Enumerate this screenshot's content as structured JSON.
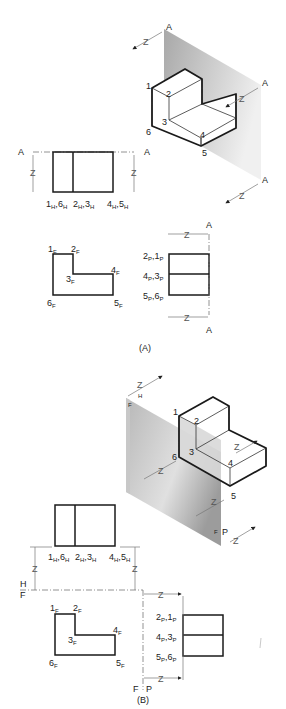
{
  "figure_A": {
    "caption": "(A)",
    "plane_label": "A",
    "depth_label": "Z",
    "iso_labels": [
      "1",
      "2",
      "3",
      "4",
      "5",
      "6"
    ],
    "top_view": {
      "labels": [
        {
          "main": "1",
          "sub": "H",
          "main2": "6",
          "sub2": "H"
        },
        {
          "main": "2",
          "sub": "H",
          "main2": "3",
          "sub2": "H"
        },
        {
          "main": "4",
          "sub": "H",
          "main2": "5",
          "sub2": "H"
        }
      ]
    },
    "front_view": {
      "labels": [
        {
          "main": "1",
          "sub": "F"
        },
        {
          "main": "2",
          "sub": "F"
        },
        {
          "main": "3",
          "sub": "F"
        },
        {
          "main": "4",
          "sub": "F"
        },
        {
          "main": "5",
          "sub": "F"
        },
        {
          "main": "6",
          "sub": "F"
        }
      ]
    },
    "side_view": {
      "labels": [
        {
          "main": "2",
          "sub": "P",
          "main2": "1",
          "sub2": "P"
        },
        {
          "main": "4",
          "sub": "P",
          "main2": "3",
          "sub2": "P"
        },
        {
          "main": "5",
          "sub": "P",
          "main2": "6",
          "sub2": "P"
        }
      ]
    }
  },
  "figure_B": {
    "caption": "(B)",
    "depth_label": "Z",
    "plane_labels": {
      "H": "H",
      "F": "F",
      "P": "P"
    },
    "iso_labels": [
      "1",
      "2",
      "3",
      "4",
      "5",
      "6"
    ],
    "top_view": {
      "labels": [
        {
          "main": "1",
          "sub": "H",
          "main2": "6",
          "sub2": "H"
        },
        {
          "main": "2",
          "sub": "H",
          "main2": "3",
          "sub2": "H"
        },
        {
          "main": "4",
          "sub": "H",
          "main2": "5",
          "sub2": "H"
        }
      ]
    },
    "front_view": {
      "labels": [
        {
          "main": "1",
          "sub": "F"
        },
        {
          "main": "2",
          "sub": "F"
        },
        {
          "main": "3",
          "sub": "F"
        },
        {
          "main": "4",
          "sub": "F"
        },
        {
          "main": "5",
          "sub": "F"
        },
        {
          "main": "6",
          "sub": "F"
        }
      ]
    },
    "side_view": {
      "labels": [
        {
          "main": "2",
          "sub": "P",
          "main2": "1",
          "sub2": "P"
        },
        {
          "main": "4",
          "sub": "P",
          "main2": "3",
          "sub2": "P"
        },
        {
          "main": "5",
          "sub": "P",
          "main2": "6",
          "sub2": "P"
        }
      ]
    }
  },
  "colors": {
    "line": "#1a1a1a",
    "plane_dark": "#9a9a9a",
    "plane_light": "#f2f2f2",
    "dim": "#777777"
  }
}
